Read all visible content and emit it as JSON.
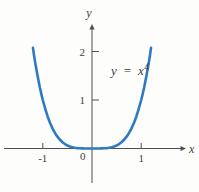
{
  "figure": {
    "background": "#fdfdfc",
    "axis_color": "#4f4f4f",
    "text_color": "#3e3e3e",
    "curve_color": "#2e7ac2",
    "x_axis_label": "x",
    "y_axis_label": "y",
    "origin_label": "0",
    "equation": {
      "base": "y = x",
      "exponent": "4"
    }
  },
  "chart_data": {
    "type": "line",
    "title": "",
    "equation_text": "y = x^4",
    "xlabel": "x",
    "ylabel": "y",
    "grid": false,
    "x_range": [
      -1.2,
      1.2
    ],
    "y_range": [
      0,
      2.0736
    ],
    "x_ticks": [
      {
        "value": -1,
        "label": "-1"
      },
      {
        "value": 1,
        "label": "1"
      }
    ],
    "y_ticks": [
      {
        "value": 1,
        "label": "1"
      },
      {
        "value": 2,
        "label": "2"
      }
    ],
    "series": [
      {
        "name": "y = x^4",
        "x": [
          -1.2,
          -1.18,
          -1.15,
          -1.12,
          -1.09,
          -1.06,
          -1.03,
          -1,
          -0.95,
          -0.9,
          -0.85,
          -0.8,
          -0.75,
          -0.7,
          -0.65,
          -0.6,
          -0.55,
          -0.5,
          -0.45,
          -0.4,
          -0.35,
          -0.3,
          -0.25,
          -0.2,
          -0.15,
          -0.1,
          -0.05,
          0,
          0.05,
          0.1,
          0.15,
          0.2,
          0.25,
          0.3,
          0.35,
          0.4,
          0.45,
          0.5,
          0.55,
          0.6,
          0.65,
          0.7,
          0.75,
          0.8,
          0.85,
          0.9,
          0.95,
          1,
          1.03,
          1.06,
          1.09,
          1.12,
          1.15,
          1.18,
          1.2
        ],
        "y": [
          2.0736,
          1.9388,
          1.749,
          1.5735,
          1.4116,
          1.2625,
          1.1255,
          1,
          0.8145,
          0.6561,
          0.522,
          0.4096,
          0.3164,
          0.2401,
          0.1785,
          0.1296,
          0.0915,
          0.0625,
          0.041,
          0.0256,
          0.015,
          0.0081,
          0.0039,
          0.0016,
          0.0005,
          0.0001,
          0,
          0,
          0,
          0.0001,
          0.0005,
          0.0016,
          0.0039,
          0.0081,
          0.015,
          0.0256,
          0.041,
          0.0625,
          0.0915,
          0.1296,
          0.1785,
          0.2401,
          0.3164,
          0.4096,
          0.522,
          0.6561,
          0.8145,
          1,
          1.1255,
          1.2625,
          1.4116,
          1.5735,
          1.749,
          1.9388,
          2.0736
        ]
      }
    ],
    "layout": {
      "origin_px": {
        "x": 92,
        "y": 148.5
      },
      "px_per_unit": {
        "x": 49.2,
        "y": 48.5
      },
      "x_axis_px": {
        "start": 4,
        "end": 181
      },
      "y_axis_px": {
        "top": 27,
        "bottom": 183
      }
    }
  }
}
